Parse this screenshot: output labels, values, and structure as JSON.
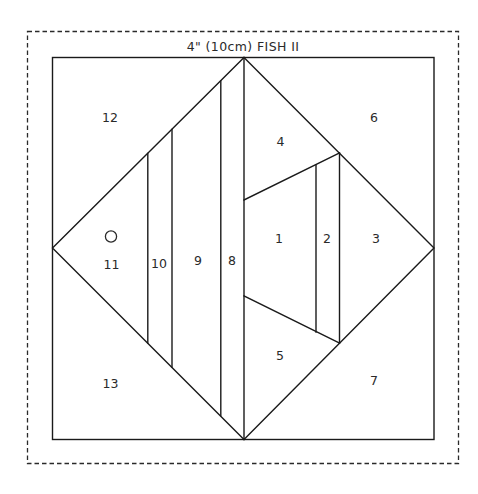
{
  "title": "4\" (10cm) FISH II",
  "colors": {
    "line": "#1a1a1a",
    "text": "#2a2a2a",
    "background": "#ffffff"
  },
  "pieces": [
    {
      "id": "1",
      "label": "1"
    },
    {
      "id": "2",
      "label": "2"
    },
    {
      "id": "3",
      "label": "3"
    },
    {
      "id": "4",
      "label": "4"
    },
    {
      "id": "5",
      "label": "5"
    },
    {
      "id": "6",
      "label": "6"
    },
    {
      "id": "7",
      "label": "7"
    },
    {
      "id": "8",
      "label": "8"
    },
    {
      "id": "9",
      "label": "9"
    },
    {
      "id": "10",
      "label": "10"
    },
    {
      "id": "11",
      "label": "11"
    },
    {
      "id": "12",
      "label": "12"
    },
    {
      "id": "13",
      "label": "13"
    }
  ],
  "icons": {
    "eye": "circle-outline"
  }
}
